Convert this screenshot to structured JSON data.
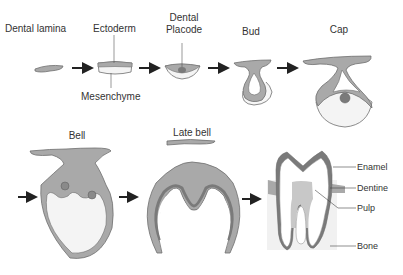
{
  "stages": {
    "dental_lamina": "Dental lamina",
    "ectoderm": "Ectoderm",
    "mesenchyme": "Mesenchyme",
    "dental_placode_1": "Dental",
    "dental_placode_2": "Placode",
    "bud": "Bud",
    "cap": "Cap",
    "bell": "Bell",
    "late_bell": "Late bell"
  },
  "tooth_parts": {
    "enamel": "Enamel",
    "dentine": "Dentine",
    "pulp": "Pulp",
    "bone": "Bone"
  },
  "colors": {
    "epithelium": "#a9a9a9",
    "outline": "#6e6e6e",
    "dark": "#7a7a7a",
    "light": "#f2f2f2",
    "arrow": "#222222"
  }
}
